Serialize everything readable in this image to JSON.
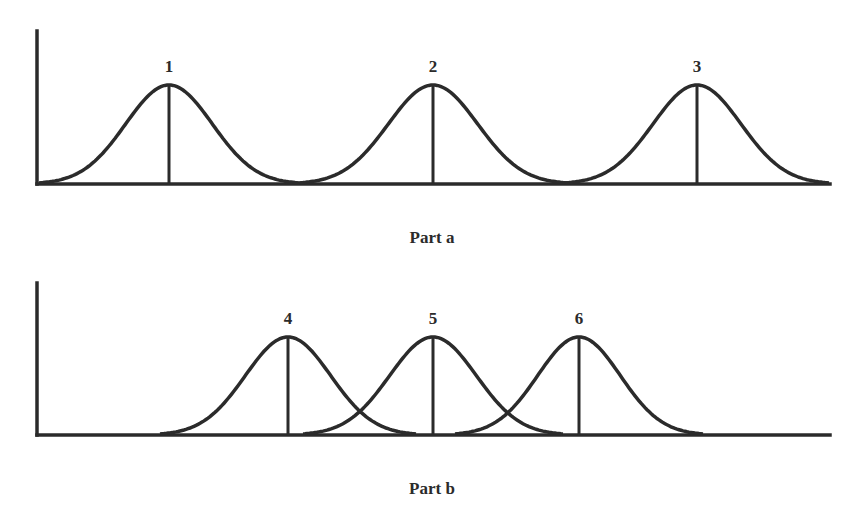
{
  "panels": [
    {
      "caption": "Part a",
      "curves": [
        {
          "label": "1",
          "center": 169,
          "halfwidth": 130
        },
        {
          "label": "2",
          "center": 433,
          "halfwidth": 134
        },
        {
          "label": "3",
          "center": 697,
          "halfwidth": 132
        }
      ]
    },
    {
      "caption": "Part b",
      "curves": [
        {
          "label": "4",
          "center": 288,
          "halfwidth": 128
        },
        {
          "label": "5",
          "center": 433,
          "halfwidth": 130
        },
        {
          "label": "6",
          "center": 579,
          "halfwidth": 124
        }
      ]
    }
  ],
  "colors": {
    "stroke": "#2b2b2b",
    "background": "#ffffff"
  }
}
